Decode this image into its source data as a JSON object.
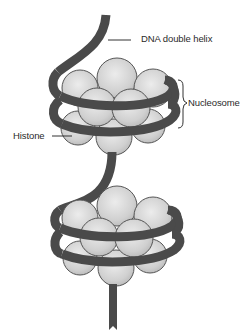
{
  "diagram": {
    "labels": {
      "dna": "DNA double helix",
      "nucleosome": "Nucleosome",
      "histone": "Histone"
    },
    "colors": {
      "dna_strand": "#4a4a4a",
      "histone_fill": "#d4d4d4",
      "histone_outline": "#555555",
      "label_text": "#2a2a2a",
      "background": "#ffffff"
    },
    "nucleosome_count": 2
  }
}
